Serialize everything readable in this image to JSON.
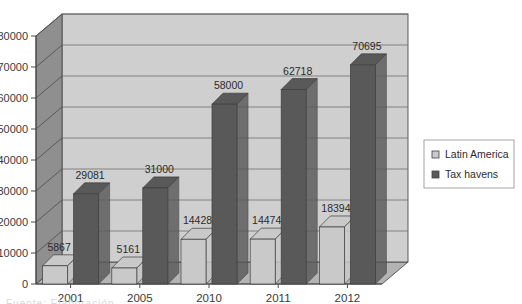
{
  "chart_data": {
    "type": "bar",
    "title": "",
    "subtitle": "",
    "xlabel": "",
    "ylabel": "",
    "categories": [
      "2001",
      "2005",
      "2010",
      "2011",
      "2012"
    ],
    "series": [
      {
        "name": "Latin America",
        "color": "#c9c9c9",
        "values": [
          5867,
          5161,
          14428,
          14474,
          18394
        ]
      },
      {
        "name": "Tax havens",
        "color": "#595959",
        "values": [
          29081,
          31000,
          58000,
          62718,
          70695
        ]
      }
    ],
    "ylim": [
      0,
      80000
    ],
    "ytick_step": 10000,
    "yticks": [
      "0",
      "10000",
      "20000",
      "30000",
      "40000",
      "50000",
      "60000",
      "70000",
      "80000"
    ],
    "grid": "horizontal",
    "legend_position": "right",
    "style": "3d-clustered-column-grayscale",
    "data_labels": {
      "latin_america": [
        "5867",
        "5161",
        "14428",
        "14474",
        "18394"
      ],
      "tax_havens": [
        "29081",
        "31000",
        "58000",
        "62718",
        "70695"
      ]
    }
  },
  "legend": {
    "items": [
      {
        "label": "Latin America",
        "swatch": "#c9c9c9"
      },
      {
        "label": "Tax havens",
        "swatch": "#595959"
      }
    ]
  },
  "colors": {
    "plot_back_wall": "#cfcfcf",
    "plot_side_wall": "#8f8f8f",
    "plot_floor": "#b3b3b3",
    "gridline": "#6e6e6e",
    "axis_line": "#4a4a4a",
    "series_light": "#c9c9c9",
    "series_dark": "#595959",
    "text": "#2b2b2b",
    "legend_border": "#9a9a9a",
    "page_background": "#ffffff"
  },
  "footer": {
    "cropped_text": "Fuente: Elaboración"
  }
}
